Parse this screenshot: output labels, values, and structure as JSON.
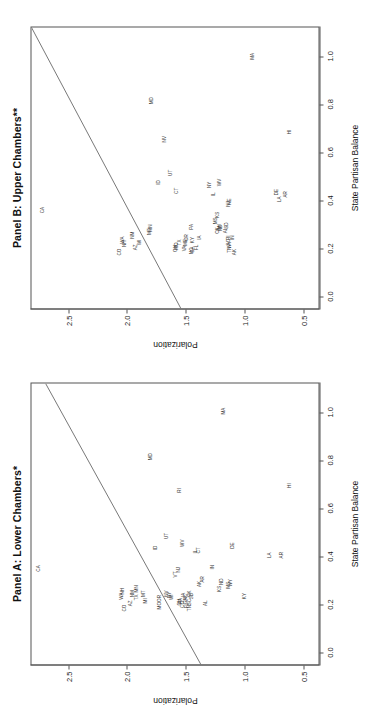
{
  "figure": {
    "orientation": "rotated-90-ccw",
    "xlabel": "State Partisan Balance",
    "ylabel": "Polarization",
    "xticks": [
      "0.0",
      "0.2",
      "0.4",
      "0.6",
      "0.8",
      "1.0"
    ],
    "yticks": [
      "0.5",
      "1.0",
      "1.5",
      "2.0",
      "2.5"
    ],
    "panel_a_title": "Panel A: Lower Chambers*",
    "panel_b_title": "Panel B: Upper Chambers**"
  },
  "chart_data": [
    {
      "type": "scatter",
      "title": "Panel A: Lower Chambers*",
      "xlabel": "State Partisan Balance",
      "ylabel": "Polarization",
      "xlim": [
        -0.05,
        1.12
      ],
      "ylim": [
        0.38,
        2.82
      ],
      "xticks": [
        0.0,
        0.2,
        0.4,
        0.6,
        0.8,
        1.0
      ],
      "yticks": [
        0.5,
        1.0,
        1.5,
        2.0,
        2.5
      ],
      "grid": false,
      "legend": null,
      "label_field": "state",
      "fit_line": {
        "x": [
          -0.05,
          1.12
        ],
        "y": [
          1.38,
          2.7
        ],
        "type": "regression"
      },
      "points": [
        {
          "state": "CA",
          "x": 0.35,
          "y": 2.75
        },
        {
          "state": "CO",
          "x": 0.185,
          "y": 2.02
        },
        {
          "state": "WA",
          "x": 0.235,
          "y": 2.05
        },
        {
          "state": "NH",
          "x": 0.255,
          "y": 2.04
        },
        {
          "state": "AZ",
          "x": 0.205,
          "y": 1.97
        },
        {
          "state": "NM",
          "x": 0.245,
          "y": 1.95
        },
        {
          "state": "TX",
          "x": 0.23,
          "y": 1.92
        },
        {
          "state": "MN",
          "x": 0.265,
          "y": 1.92
        },
        {
          "state": "MT",
          "x": 0.245,
          "y": 1.86
        },
        {
          "state": "MI",
          "x": 0.215,
          "y": 1.84
        },
        {
          "state": "MO",
          "x": 0.195,
          "y": 1.72
        },
        {
          "state": "OR",
          "x": 0.225,
          "y": 1.72
        },
        {
          "state": "NV",
          "x": 0.245,
          "y": 1.66
        },
        {
          "state": "NY",
          "x": 0.24,
          "y": 1.64
        },
        {
          "state": "WI",
          "x": 0.23,
          "y": 1.62
        },
        {
          "state": "ID",
          "x": 0.435,
          "y": 1.76
        },
        {
          "state": "UT",
          "x": 0.485,
          "y": 1.66
        },
        {
          "state": "MD",
          "x": 0.815,
          "y": 1.8
        },
        {
          "state": "VT",
          "x": 0.325,
          "y": 1.59
        },
        {
          "state": "NJ",
          "x": 0.345,
          "y": 1.565
        },
        {
          "state": "OH",
          "x": 0.21,
          "y": 1.555
        },
        {
          "state": "PA",
          "x": 0.215,
          "y": 1.545
        },
        {
          "state": "CO2",
          "x": 0.2,
          "y": 1.525
        },
        {
          "state": "GA",
          "x": 0.215,
          "y": 1.505
        },
        {
          "state": "FL",
          "x": 0.195,
          "y": 1.49
        },
        {
          "state": "IA",
          "x": 0.24,
          "y": 1.52
        },
        {
          "state": "NC",
          "x": 0.23,
          "y": 1.5
        },
        {
          "state": "RI",
          "x": 0.675,
          "y": 1.55
        },
        {
          "state": "WV",
          "x": 0.455,
          "y": 1.53
        },
        {
          "state": "TN",
          "x": 0.185,
          "y": 1.47
        },
        {
          "state": "SC",
          "x": 0.21,
          "y": 1.465
        },
        {
          "state": "OK",
          "x": 0.245,
          "y": 1.465
        },
        {
          "state": "SD",
          "x": 0.235,
          "y": 1.455
        },
        {
          "state": "IL",
          "x": 0.42,
          "y": 1.42
        },
        {
          "state": "CT",
          "x": 0.425,
          "y": 1.395
        },
        {
          "state": "AK",
          "x": 0.285,
          "y": 1.38
        },
        {
          "state": "AR",
          "x": 0.305,
          "y": 1.355
        },
        {
          "state": "AL",
          "x": 0.205,
          "y": 1.33
        },
        {
          "state": "IN",
          "x": 0.355,
          "y": 1.27
        },
        {
          "state": "KS",
          "x": 0.265,
          "y": 1.21
        },
        {
          "state": "ND",
          "x": 0.295,
          "y": 1.2
        },
        {
          "state": "MS",
          "x": 0.28,
          "y": 1.14
        },
        {
          "state": "WY",
          "x": 0.29,
          "y": 1.12
        },
        {
          "state": "KY",
          "x": 0.235,
          "y": 1.0
        },
        {
          "state": "DE",
          "x": 0.445,
          "y": 1.1
        },
        {
          "state": "LA",
          "x": 0.405,
          "y": 0.79
        },
        {
          "state": "HI",
          "x": 0.695,
          "y": 0.62
        },
        {
          "state": "AR2",
          "x": 0.405,
          "y": 0.69
        },
        {
          "state": "MA",
          "x": 1.005,
          "y": 1.18
        }
      ]
    },
    {
      "type": "scatter",
      "title": "Panel B: Upper Chambers**",
      "xlabel": "State Partisan Balance",
      "ylabel": "Polarization",
      "xlim": [
        -0.05,
        1.12
      ],
      "ylim": [
        0.38,
        2.82
      ],
      "xticks": [
        0.0,
        0.2,
        0.4,
        0.6,
        0.8,
        1.0
      ],
      "yticks": [
        0.5,
        1.0,
        1.5,
        2.0,
        2.5
      ],
      "grid": false,
      "legend": null,
      "label_field": "state",
      "fit_line": {
        "x": [
          -0.05,
          1.12
        ],
        "y": [
          1.55,
          2.82
        ],
        "type": "regression"
      },
      "points": [
        {
          "state": "CA",
          "x": 0.36,
          "y": 2.72
        },
        {
          "state": "CO",
          "x": 0.185,
          "y": 2.06
        },
        {
          "state": "NH",
          "x": 0.22,
          "y": 2.02
        },
        {
          "state": "WA",
          "x": 0.235,
          "y": 2.04
        },
        {
          "state": "AZ",
          "x": 0.205,
          "y": 1.93
        },
        {
          "state": "NM",
          "x": 0.255,
          "y": 1.95
        },
        {
          "state": "WI",
          "x": 0.225,
          "y": 1.89
        },
        {
          "state": "MT",
          "x": 0.27,
          "y": 1.81
        },
        {
          "state": "MN",
          "x": 0.285,
          "y": 1.8
        },
        {
          "state": "MD",
          "x": 0.815,
          "y": 1.79
        },
        {
          "state": "ID",
          "x": 0.475,
          "y": 1.73
        },
        {
          "state": "NV",
          "x": 0.655,
          "y": 1.68
        },
        {
          "state": "UT",
          "x": 0.515,
          "y": 1.63
        },
        {
          "state": "CT",
          "x": 0.44,
          "y": 1.58
        },
        {
          "state": "OH",
          "x": 0.2,
          "y": 1.585
        },
        {
          "state": "MO",
          "x": 0.21,
          "y": 1.575
        },
        {
          "state": "TX",
          "x": 0.225,
          "y": 1.555
        },
        {
          "state": "VA",
          "x": 0.2,
          "y": 1.51
        },
        {
          "state": "ME",
          "x": 0.225,
          "y": 1.5
        },
        {
          "state": "OR",
          "x": 0.245,
          "y": 1.49
        },
        {
          "state": "NC",
          "x": 0.19,
          "y": 1.455
        },
        {
          "state": "GA",
          "x": 0.195,
          "y": 1.44
        },
        {
          "state": "KY",
          "x": 0.235,
          "y": 1.44
        },
        {
          "state": "FL",
          "x": 0.205,
          "y": 1.41
        },
        {
          "state": "PA",
          "x": 0.29,
          "y": 1.45
        },
        {
          "state": "IA",
          "x": 0.245,
          "y": 1.385
        },
        {
          "state": "NY",
          "x": 0.465,
          "y": 1.295
        },
        {
          "state": "IL",
          "x": 0.425,
          "y": 1.26
        },
        {
          "state": "KS",
          "x": 0.34,
          "y": 1.23
        },
        {
          "state": "WV",
          "x": 0.475,
          "y": 1.21
        },
        {
          "state": "MI",
          "x": 0.29,
          "y": 1.215
        },
        {
          "state": "OK",
          "x": 0.275,
          "y": 1.23
        },
        {
          "state": "MS",
          "x": 0.315,
          "y": 1.25
        },
        {
          "state": "NJ",
          "x": 0.385,
          "y": 1.14
        },
        {
          "state": "NE",
          "x": 0.395,
          "y": 1.13
        },
        {
          "state": "SD",
          "x": 0.295,
          "y": 1.155
        },
        {
          "state": "TN",
          "x": 0.195,
          "y": 1.13
        },
        {
          "state": "SC",
          "x": 0.225,
          "y": 1.135
        },
        {
          "state": "WY",
          "x": 0.215,
          "y": 1.13
        },
        {
          "state": "RI2",
          "x": 0.245,
          "y": 1.14
        },
        {
          "state": "IN",
          "x": 0.245,
          "y": 1.1
        },
        {
          "state": "AK",
          "x": 0.185,
          "y": 1.085
        },
        {
          "state": "AL",
          "x": 0.275,
          "y": 1.165
        },
        {
          "state": "ND",
          "x": 0.285,
          "y": 1.205
        },
        {
          "state": "HI",
          "x": 0.685,
          "y": 0.62
        },
        {
          "state": "LA",
          "x": 0.405,
          "y": 0.7
        },
        {
          "state": "DE",
          "x": 0.435,
          "y": 0.73
        },
        {
          "state": "AR",
          "x": 0.425,
          "y": 0.655
        },
        {
          "state": "MA",
          "x": 1.0,
          "y": 0.93
        }
      ]
    }
  ]
}
